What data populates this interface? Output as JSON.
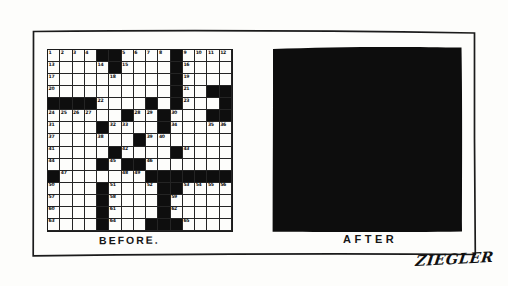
{
  "panel": {
    "before_label": "BEFORE.",
    "after_label": "AFTER",
    "signature": "ZIEGLER"
  },
  "crossword": {
    "rows": 15,
    "cols": 15,
    "pattern": [
      "....##....#....",
      ".....#....#....",
      "..........#....",
      "..........#..##",
      "####....#.#...#",
      "......#..#...##",
      "....#....#.....",
      ".......#.......",
      ".....#....#....",
      "....#.##.......",
      "#.......#######",
      "....#....##....",
      "....#....#.....",
      "....#....#.....",
      "....#...###...."
    ]
  },
  "colors": {
    "ink": "#1b1b1b",
    "fill_black": "#0d0d0d",
    "paper": "#fdfdfb"
  }
}
